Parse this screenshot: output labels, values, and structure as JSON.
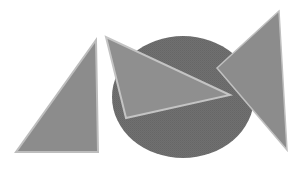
{
  "figure": {
    "shapes": [
      {
        "name": "ellipse",
        "kind": "ellipse",
        "fill": "#6e6e6e"
      },
      {
        "name": "left-triangle",
        "kind": "triangle",
        "fill": "#8c8c8c",
        "stroke": "#bdbdbd"
      },
      {
        "name": "middle-triangle",
        "kind": "triangle",
        "fill": "#8f8f8f",
        "stroke": "#c4c4c4"
      },
      {
        "name": "right-triangle",
        "kind": "triangle",
        "fill": "#8c8c8c",
        "stroke": "#c0c0c0"
      }
    ]
  }
}
